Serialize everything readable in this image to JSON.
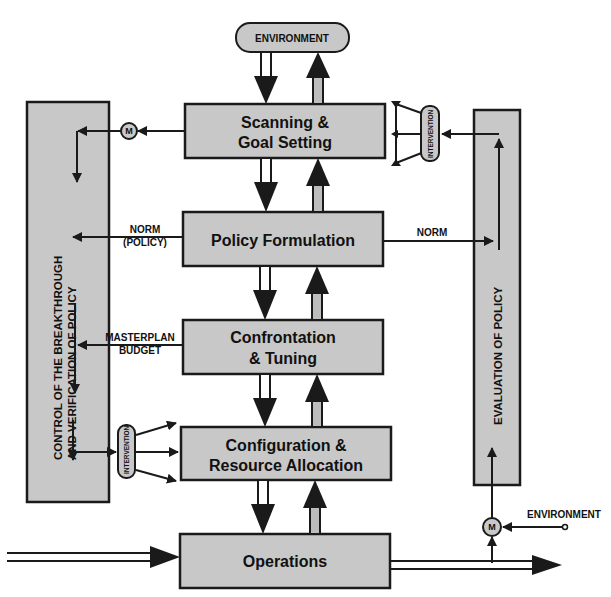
{
  "diagram": {
    "environment_top": "ENVIRONMENT",
    "environment_right": "ENVIRONMENT",
    "process_boxes": [
      {
        "id": "scanning",
        "line1": "Scanning &",
        "line2": "Goal Setting"
      },
      {
        "id": "policy",
        "line1": "Policy Formulation",
        "line2": ""
      },
      {
        "id": "confrontation",
        "line1": "Confrontation",
        "line2": "& Tuning"
      },
      {
        "id": "configuration",
        "line1": "Configuration &",
        "line2": "Resource Allocation"
      },
      {
        "id": "operations",
        "line1": "Operations",
        "line2": ""
      }
    ],
    "left_panel": {
      "line1": "CONTROL OF THE BREAKTHROUGH",
      "line2": "AND VERIFICATION OF POLICY"
    },
    "right_panel": {
      "label": "EVALUATION OF POLICY"
    },
    "edge_labels": {
      "norm_policy_1": "NORM",
      "norm_policy_2": "(POLICY)",
      "masterplan": "MASTERPLAN",
      "budget": "BUDGET",
      "norm_right": "NORM"
    },
    "intervention": "INTERVENTION",
    "monitor_symbol": "M",
    "colors": {
      "box_fill": "#c8c8c8",
      "stroke": "#1a1a1a",
      "background": "#ffffff"
    }
  }
}
